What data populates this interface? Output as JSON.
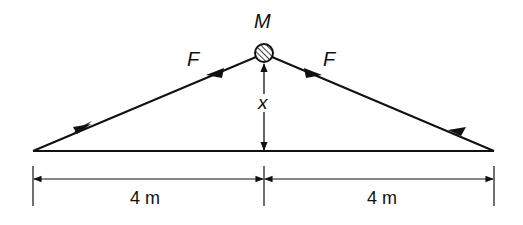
{
  "diagram": {
    "mass_label": "M",
    "force_left_label": "F",
    "force_right_label": "F",
    "height_label": "x",
    "left_span_label": "4 m",
    "right_span_label": "4 m"
  },
  "colors": {
    "ink": "#111111",
    "background": "#ffffff"
  }
}
